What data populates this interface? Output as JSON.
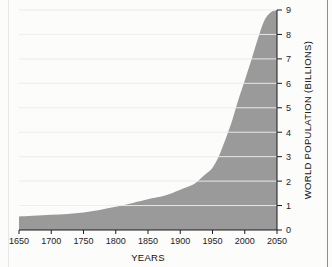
{
  "figure": {
    "background_color": "#fcfcfb",
    "fill_color": "#9a9a9a",
    "gridline_color": "#f2f2f2",
    "axis_color": "#1b1b1b"
  },
  "chart_data": {
    "type": "area",
    "title": "",
    "xlabel": "YEARS",
    "ylabel": "WORLD POPULATION (BILLIONS)",
    "xlim": [
      1650,
      2050
    ],
    "ylim": [
      0,
      9
    ],
    "grid": true,
    "legend": "none",
    "xticks": [
      1650,
      1700,
      1750,
      1800,
      1850,
      1900,
      1950,
      2000,
      2050
    ],
    "xtick_labels": [
      "1650",
      "1700",
      "1750",
      "1800",
      "1850",
      "1900",
      "1950",
      "2000",
      "2050"
    ],
    "yticks": [
      0,
      1,
      2,
      3,
      4,
      5,
      6,
      7,
      8,
      9
    ],
    "ytick_labels": [
      "0",
      "1",
      "2",
      "3",
      "4",
      "5",
      "6",
      "7",
      "8",
      "9"
    ],
    "ytick_side": "right",
    "series": [
      {
        "name": "World population",
        "x": [
          1650,
          1700,
          1750,
          1800,
          1850,
          1875,
          1900,
          1920,
          1930,
          1940,
          1950,
          1960,
          1970,
          1980,
          1990,
          2000,
          2010,
          2020,
          2030,
          2040,
          2050
        ],
        "values": [
          0.55,
          0.62,
          0.72,
          0.95,
          1.26,
          1.4,
          1.65,
          1.86,
          2.07,
          2.3,
          2.55,
          3.03,
          3.7,
          4.44,
          5.32,
          6.12,
          6.93,
          7.79,
          8.55,
          8.9,
          9.0
        ]
      }
    ]
  }
}
